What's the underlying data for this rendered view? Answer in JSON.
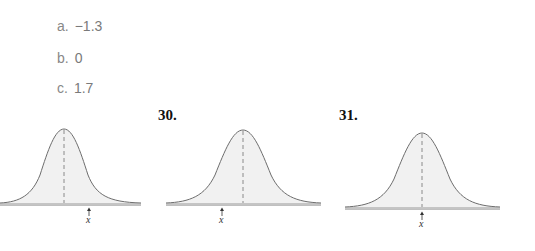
{
  "options": [
    {
      "label": "a.",
      "value": "−1.3"
    },
    {
      "label": "b.",
      "value": "0"
    },
    {
      "label": "c.",
      "value": "1.7"
    }
  ],
  "problems": [
    {
      "number": "",
      "arrow_label": "x",
      "mean_x": 64,
      "x_pos": 89
    },
    {
      "number": "30.",
      "arrow_label": "x",
      "mean_x": 243,
      "x_pos": 222
    },
    {
      "number": "31.",
      "arrow_label": "x",
      "mean_x": 422,
      "x_pos": 422
    }
  ],
  "colors": {
    "curve": "#6d6d6d",
    "fill": "#f1f1f1",
    "dash": "#8a8a8a",
    "text": "#7a7a7a"
  }
}
